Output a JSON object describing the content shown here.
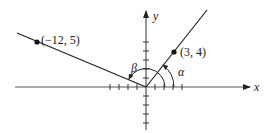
{
  "diagram": {
    "title": "",
    "axes": {
      "x_label": "x",
      "y_label": "y",
      "origin": [
        0,
        0
      ],
      "tick_count_each_side": 4
    },
    "points": [
      {
        "id": "p1",
        "label": "(3, 4)",
        "x": 3,
        "y": 4
      },
      {
        "id": "p2",
        "label": "(−12, 5)",
        "x": -12,
        "y": 5
      }
    ],
    "angles": [
      {
        "id": "alpha",
        "label": "α",
        "from": "positive x-axis",
        "to": "ray through (3, 4)"
      },
      {
        "id": "beta",
        "label": "β",
        "from": "positive x-axis",
        "to": "ray through (−12, 5)"
      }
    ],
    "colors": {
      "line": "#222222",
      "axis": "#555555",
      "background": "#ffffff"
    }
  }
}
